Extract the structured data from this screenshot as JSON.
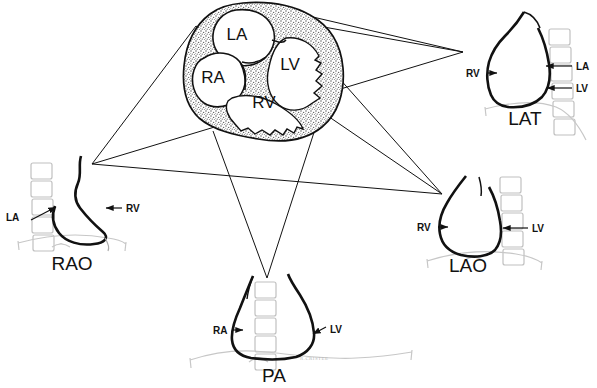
{
  "figure": {
    "background_color": "#ffffff",
    "ink_color": "#111111",
    "myocardium_fill": "#8d8d8d",
    "spine_color": "#c9c9c9",
    "diaphragm_color": "#cccccc",
    "signature": "R.CRISTEE"
  },
  "central": {
    "name": "short-axis heart cross-section",
    "chambers": [
      {
        "id": "LA",
        "label": "LA",
        "x": 237,
        "y": 40
      },
      {
        "id": "RA",
        "label": "RA",
        "x": 213,
        "y": 83
      },
      {
        "id": "LV",
        "label": "LV",
        "x": 290,
        "y": 70
      },
      {
        "id": "RV",
        "label": "RV",
        "x": 264,
        "y": 108
      }
    ]
  },
  "views": [
    {
      "id": "rao",
      "title": "RAO",
      "title_x": 72,
      "title_y": 270,
      "spine_side": "left",
      "vertebra_count": 5,
      "callouts": [
        {
          "label": "LA",
          "side": "left",
          "x": 16,
          "y": 218
        },
        {
          "label": "RV",
          "side": "right",
          "x": 122,
          "y": 211
        }
      ]
    },
    {
      "id": "lat",
      "title": "LAT",
      "title_x": 525,
      "title_y": 125,
      "spine_side": "right",
      "vertebra_count": 6,
      "callouts": [
        {
          "label": "RV",
          "side": "left",
          "x": 466,
          "y": 76
        },
        {
          "label": "LA",
          "side": "right",
          "x": 578,
          "y": 70
        },
        {
          "label": "LV",
          "side": "right",
          "x": 578,
          "y": 92
        }
      ]
    },
    {
      "id": "lao",
      "title": "LAO",
      "title_x": 468,
      "title_y": 272,
      "spine_side": "right",
      "vertebra_count": 5,
      "callouts": [
        {
          "label": "RV",
          "side": "left",
          "x": 422,
          "y": 230
        },
        {
          "label": "LV",
          "side": "right",
          "x": 534,
          "y": 232
        }
      ]
    },
    {
      "id": "pa",
      "title": "PA",
      "title_x": 274,
      "title_y": 382,
      "spine_side": "center",
      "vertebra_count": 5,
      "callouts": [
        {
          "label": "RA",
          "side": "left",
          "x": 219,
          "y": 333
        },
        {
          "label": "LV",
          "side": "right",
          "x": 311,
          "y": 333
        }
      ]
    }
  ],
  "projection_rays": {
    "description": "star of projection lines from the central cross-section to each peripheral view",
    "vertices": [
      {
        "id": "left-vertex",
        "x": 92,
        "y": 164
      },
      {
        "id": "upper-right-vertex",
        "x": 463,
        "y": 52
      },
      {
        "id": "lower-right-vertex",
        "x": 442,
        "y": 194
      },
      {
        "id": "bottom-vertex",
        "x": 267,
        "y": 278
      }
    ]
  }
}
